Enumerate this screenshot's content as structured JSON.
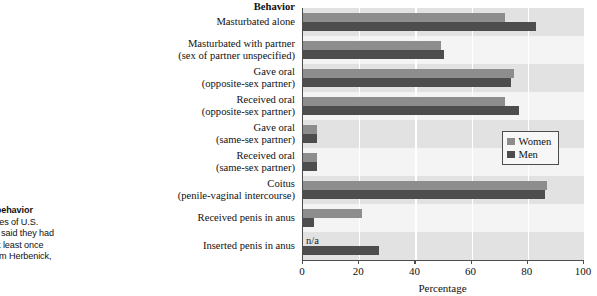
{
  "caption": {
    "line1": "iew of sexual behavior",
    "line2": "s the percentages of U.S.",
    "line3": "e 25 to 29, who said they had",
    "line4": "ified behavior at least once",
    "line5": "onths. (Data from Herbenick,",
    "line6": "2010.)"
  },
  "legend": {
    "women_label": "Women",
    "men_label": "Men",
    "women_color": "#8d8d8d",
    "men_color": "#4d4d4d"
  },
  "axis_title": "Behavior",
  "na_text": "n/a",
  "chart_data": {
    "type": "bar",
    "orientation": "horizontal",
    "title": "",
    "xlabel": "Percentage",
    "ylabel": "Behavior",
    "xlim": [
      0,
      100
    ],
    "xticks": [
      0,
      20,
      40,
      60,
      80,
      100
    ],
    "grid": true,
    "legend_position": "middle-right",
    "categories": [
      "Masturbated alone",
      "Masturbated with partner (sex of partner unspecified)",
      "Gave oral (opposite-sex partner)",
      "Received oral (opposite-sex partner)",
      "Gave oral (same-sex partner)",
      "Received oral (same-sex partner)",
      "Coitus (penile-vaginal intercourse)",
      "Received penis in anus",
      "Inserted penis in anus"
    ],
    "category_lines": [
      [
        "Masturbated alone"
      ],
      [
        "Masturbated with partner",
        "(sex of partner unspecified)"
      ],
      [
        "Gave oral",
        "(opposite-sex partner)"
      ],
      [
        "Received oral",
        "(opposite-sex partner)"
      ],
      [
        "Gave oral",
        "(same-sex partner)"
      ],
      [
        "Received oral",
        "(same-sex partner)"
      ],
      [
        "Coitus",
        "(penile-vaginal intercourse)"
      ],
      [
        "Received penis in anus"
      ],
      [
        "Inserted penis in anus"
      ]
    ],
    "series": [
      {
        "name": "Women",
        "color": "#8d8d8d",
        "values": [
          72,
          49,
          75,
          72,
          5,
          5,
          87,
          21,
          null
        ]
      },
      {
        "name": "Men",
        "color": "#4d4d4d",
        "values": [
          83,
          50,
          74,
          77,
          5,
          5,
          86,
          4,
          27
        ]
      }
    ],
    "annotations": [
      {
        "text": "n/a",
        "category": "Inserted penis in anus",
        "series": "Women"
      }
    ]
  }
}
